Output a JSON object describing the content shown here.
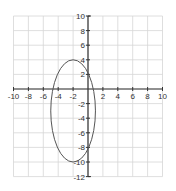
{
  "chart_data": {
    "type": "line",
    "title": "",
    "xlabel": "",
    "ylabel": "",
    "xlim": [
      -10,
      10
    ],
    "ylim": [
      -12,
      10
    ],
    "grid": true,
    "x_ticks": [
      -10,
      -8,
      -6,
      -4,
      -2,
      2,
      4,
      6,
      8,
      10
    ],
    "y_ticks": [
      10,
      8,
      6,
      4,
      2,
      -2,
      -4,
      -6,
      -8,
      -10,
      -12
    ],
    "series": [
      {
        "name": "ellipse",
        "shape": "ellipse",
        "center": [
          -2,
          -3
        ],
        "semi_axis_x": 3,
        "semi_axis_y": 7,
        "x_extent": [
          -5,
          1
        ],
        "y_extent": [
          -10,
          4
        ],
        "equation": "(x+2)^2/9 + (y+3)^2/49 = 1"
      }
    ]
  },
  "colors": {
    "grid": "#d6d6d6",
    "axis": "#333333",
    "curve": "#555555",
    "background": "#ffffff"
  }
}
